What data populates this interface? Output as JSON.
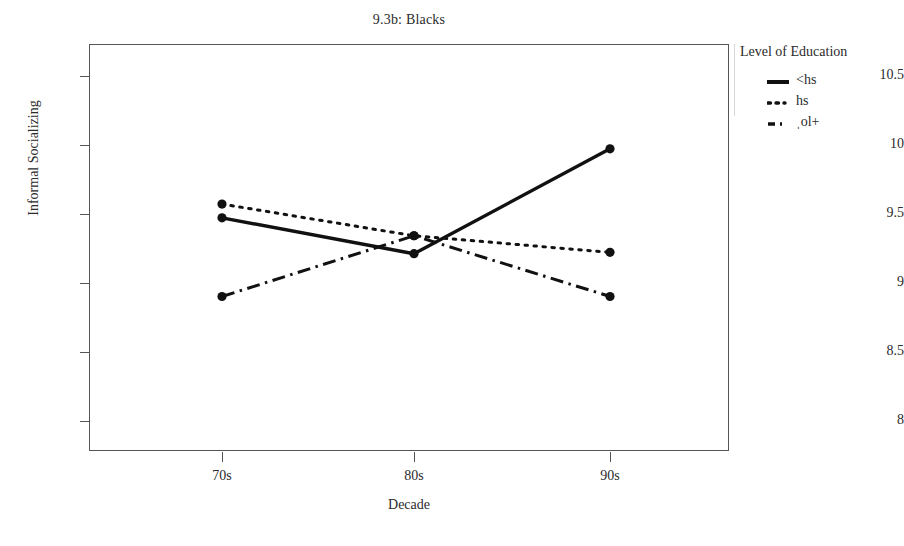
{
  "chart_data": {
    "type": "line",
    "title": "9.3b: Blacks",
    "xlabel": "Decade",
    "ylabel": "Informal Socializing",
    "categories": [
      "70s",
      "80s",
      "90s"
    ],
    "xticklabels": [
      "70s",
      "80s",
      "90s"
    ],
    "yticklabels": [
      "8",
      "8.5",
      "9",
      "9.5",
      "10",
      "10.5"
    ],
    "yticks": [
      8,
      8.5,
      9,
      9.5,
      10,
      10.5
    ],
    "ylim": [
      7.78,
      10.73
    ],
    "grid": false,
    "legend_position": "right",
    "legend_title": "Level of Education",
    "series": [
      {
        "name": "<hs",
        "style": "solid",
        "color": "#111111",
        "values": [
          9.47,
          9.21,
          9.97
        ]
      },
      {
        "name": "hs",
        "style": "dotted",
        "color": "#111111",
        "values": [
          9.57,
          9.34,
          9.22
        ]
      },
      {
        "name": "ˌol+",
        "style": "dash-dot",
        "color": "#111111",
        "values": [
          8.9,
          9.34,
          8.9
        ]
      }
    ]
  },
  "legend": {
    "title": "Level of Education",
    "items": [
      {
        "label": "<hs",
        "swatch": "solid-line-icon"
      },
      {
        "label": "hs",
        "swatch": "dotted-line-icon"
      },
      {
        "label": "ˌol+",
        "swatch": "dash-dot-line-icon"
      }
    ]
  },
  "axes": {
    "y": {
      "title": "Informal Socializing",
      "ticks": [
        {
          "label": "10.5",
          "value": 10.5
        },
        {
          "label": "10",
          "value": 10
        },
        {
          "label": "9.5",
          "value": 9.5
        },
        {
          "label": "9",
          "value": 9
        },
        {
          "label": "8.5",
          "value": 8.5
        },
        {
          "label": "8",
          "value": 8
        }
      ]
    },
    "x": {
      "title": "Decade",
      "ticks": [
        {
          "label": "70s",
          "value": 0
        },
        {
          "label": "80s",
          "value": 1
        },
        {
          "label": "90s",
          "value": 2
        }
      ]
    }
  }
}
